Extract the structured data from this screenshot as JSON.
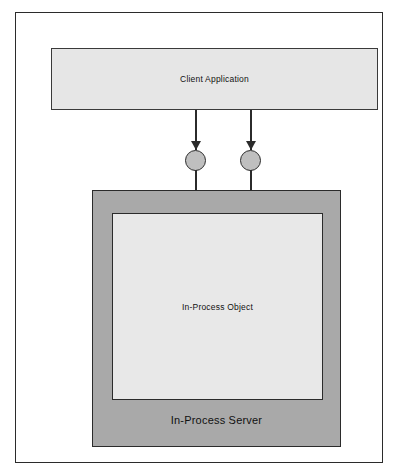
{
  "diagram": {
    "type": "component-diagram",
    "title": "In-Process Server",
    "frame": {
      "name": "outer-frame"
    },
    "client": {
      "label": "Client Application"
    },
    "server": {
      "label": "In-Process Server"
    },
    "object": {
      "label": "In-Process Object"
    },
    "connectors": [
      {
        "name": "interface-connector-1",
        "arrow_direction": "down",
        "from": "Client Application",
        "to": "In-Process Server"
      },
      {
        "name": "interface-connector-2",
        "arrow_direction": "down",
        "from": "Client Application",
        "to": "In-Process Server"
      }
    ],
    "interfaces": [
      {
        "name": "interface-circle-1"
      },
      {
        "name": "interface-circle-2"
      }
    ],
    "colors": {
      "page_background": "#ffffff",
      "frame_border": "#2b2b2b",
      "client_fill": "#e6e6e6",
      "server_fill": "#a9a9a9",
      "object_fill": "#e8e8e8",
      "circle_fill": "#bfbfbf",
      "line": "#2b2b2b",
      "text": "#111111"
    }
  }
}
